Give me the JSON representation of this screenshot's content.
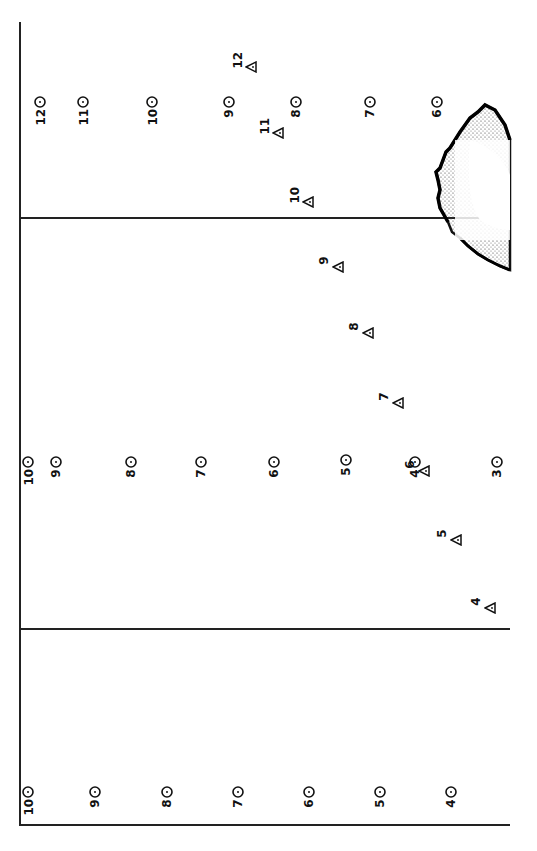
{
  "figure": {
    "panels": [
      {
        "name": "top-panel",
        "y_range": [
          22,
          218
        ]
      },
      {
        "name": "middle-panel",
        "y_range": [
          218,
          628
        ]
      },
      {
        "name": "bottom-panel",
        "y_range": [
          628,
          825
        ]
      }
    ],
    "circle_points": [
      {
        "label": "12",
        "x": 40,
        "y": 102
      },
      {
        "label": "11",
        "x": 83,
        "y": 102
      },
      {
        "label": "10",
        "x": 152,
        "y": 102
      },
      {
        "label": "9",
        "x": 229,
        "y": 102
      },
      {
        "label": "8",
        "x": 296,
        "y": 102
      },
      {
        "label": "7",
        "x": 370,
        "y": 102
      },
      {
        "label": "6",
        "x": 437,
        "y": 102
      },
      {
        "label": "10",
        "x": 28,
        "y": 462
      },
      {
        "label": "9",
        "x": 56,
        "y": 462
      },
      {
        "label": "8",
        "x": 131,
        "y": 462
      },
      {
        "label": "7",
        "x": 201,
        "y": 462
      },
      {
        "label": "6",
        "x": 274,
        "y": 462
      },
      {
        "label": "5",
        "x": 346,
        "y": 460
      },
      {
        "label": "4",
        "x": 415,
        "y": 462
      },
      {
        "label": "3",
        "x": 497,
        "y": 462
      },
      {
        "label": "10",
        "x": 28,
        "y": 792
      },
      {
        "label": "9",
        "x": 95,
        "y": 792
      },
      {
        "label": "8",
        "x": 167,
        "y": 792
      },
      {
        "label": "7",
        "x": 238,
        "y": 792
      },
      {
        "label": "6",
        "x": 309,
        "y": 792
      },
      {
        "label": "5",
        "x": 380,
        "y": 792
      },
      {
        "label": "4",
        "x": 451,
        "y": 792
      }
    ],
    "triangle_points": [
      {
        "label": "12",
        "x": 251,
        "y": 67
      },
      {
        "label": "11",
        "x": 278,
        "y": 133
      },
      {
        "label": "10",
        "x": 308,
        "y": 202
      },
      {
        "label": "9",
        "x": 338,
        "y": 267
      },
      {
        "label": "8",
        "x": 368,
        "y": 333
      },
      {
        "label": "7",
        "x": 398,
        "y": 403
      },
      {
        "label": "6",
        "x": 424,
        "y": 471
      },
      {
        "label": "5",
        "x": 456,
        "y": 540
      },
      {
        "label": "4",
        "x": 490,
        "y": 608
      }
    ]
  }
}
